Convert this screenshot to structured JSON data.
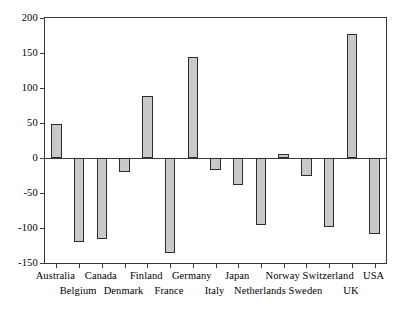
{
  "chart_data": {
    "type": "bar",
    "title": "",
    "subtitle": "",
    "xlabel": "",
    "ylabel": "",
    "categories": [
      "Australia",
      "Belgium",
      "Canada",
      "Denmark",
      "Finland",
      "France",
      "Germany",
      "Italy",
      "Japan",
      "Netherlands",
      "Norway",
      "Sweden",
      "Switzerland",
      "UK",
      "USA"
    ],
    "values": [
      48,
      -120,
      -115,
      -20,
      88,
      -135,
      145,
      -17,
      -38,
      -95,
      6,
      -25,
      -98,
      177,
      -108
    ],
    "ylim": [
      -150,
      200
    ],
    "yticks": [
      -150,
      -100,
      -50,
      0,
      50,
      100,
      150,
      200
    ],
    "ytick_labels": [
      "-150",
      "-100",
      "-50",
      "0",
      "50",
      "100",
      "150",
      "200"
    ],
    "grid": false,
    "legend": false,
    "legend_position": "none",
    "bar_fill": "#c9c9c9",
    "bar_edge": "#2d2d2d",
    "axis_color": "#3a3a3a",
    "background": "#ffffff",
    "zero_reference_line": 0,
    "label_rows": [
      0,
      1,
      0,
      1,
      0,
      1,
      0,
      1,
      0,
      1,
      0,
      1,
      0,
      1,
      0
    ]
  }
}
